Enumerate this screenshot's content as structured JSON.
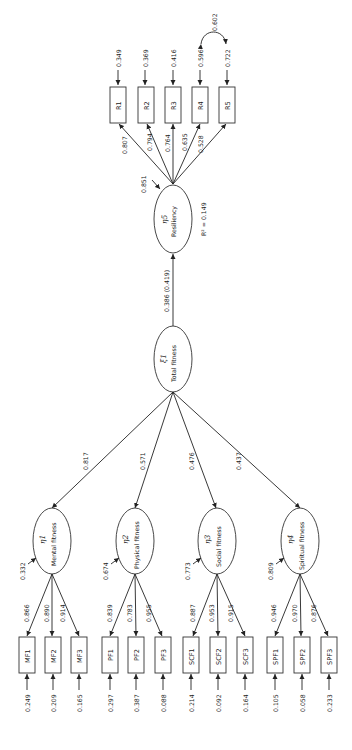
{
  "diagram": {
    "orientation": "rotated 90 degrees (text reads bottom-to-top)",
    "total": {
      "symbol": "ξ1",
      "label": "Total fitness"
    },
    "structural_path": {
      "label": "0.386 (0.419)"
    },
    "resiliency": {
      "symbol": "η5",
      "label": "Resiliency",
      "r_squared": "R² = 0.149",
      "disturbance": "0.851",
      "indicators": [
        {
          "name": "R1",
          "loading": "0.807",
          "error": "0.349"
        },
        {
          "name": "R2",
          "loading": "0.794",
          "error": "0.369"
        },
        {
          "name": "R3",
          "loading": "0.764",
          "error": "0.416"
        },
        {
          "name": "R4",
          "loading": "0.635",
          "error": "0.596"
        },
        {
          "name": "R5",
          "loading": "0.528",
          "error": "0.722"
        }
      ],
      "error_covariance": {
        "between": [
          "R4",
          "R5"
        ],
        "value": "0.602"
      }
    },
    "factors": [
      {
        "symbol": "η1",
        "label": "Mental fitness",
        "path": "0.817",
        "disturbance": "0.332",
        "indicators": [
          {
            "name": "MF1",
            "loading": "0.866",
            "error": "0.249"
          },
          {
            "name": "MF2",
            "loading": "0.890",
            "error": "0.209"
          },
          {
            "name": "MF3",
            "loading": "0.914",
            "error": "0.165"
          }
        ]
      },
      {
        "symbol": "η2",
        "label": "Physical fitness",
        "path": "0.571",
        "disturbance": "0.674",
        "indicators": [
          {
            "name": "PF1",
            "loading": "0.839",
            "error": "0.297"
          },
          {
            "name": "PF2",
            "loading": "0.783",
            "error": "0.387"
          },
          {
            "name": "PF3",
            "loading": "0.955",
            "error": "0.088"
          }
        ]
      },
      {
        "symbol": "η3",
        "label": "Social fitness",
        "path": "0.476",
        "disturbance": "0.773",
        "indicators": [
          {
            "name": "SCF1",
            "loading": "0.887",
            "error": "0.214"
          },
          {
            "name": "SCF2",
            "loading": "0.953",
            "error": "0.092"
          },
          {
            "name": "SCF3",
            "loading": "0.915",
            "error": "0.164"
          }
        ]
      },
      {
        "symbol": "η4",
        "label": "Spiritual fitness",
        "path": "0.437",
        "disturbance": "0.809",
        "indicators": [
          {
            "name": "SPF1",
            "loading": "0.946",
            "error": "0.105"
          },
          {
            "name": "SPF2",
            "loading": "0.970",
            "error": "0.058"
          },
          {
            "name": "SPF3",
            "loading": "0.876",
            "error": "0.233"
          }
        ]
      }
    ]
  }
}
